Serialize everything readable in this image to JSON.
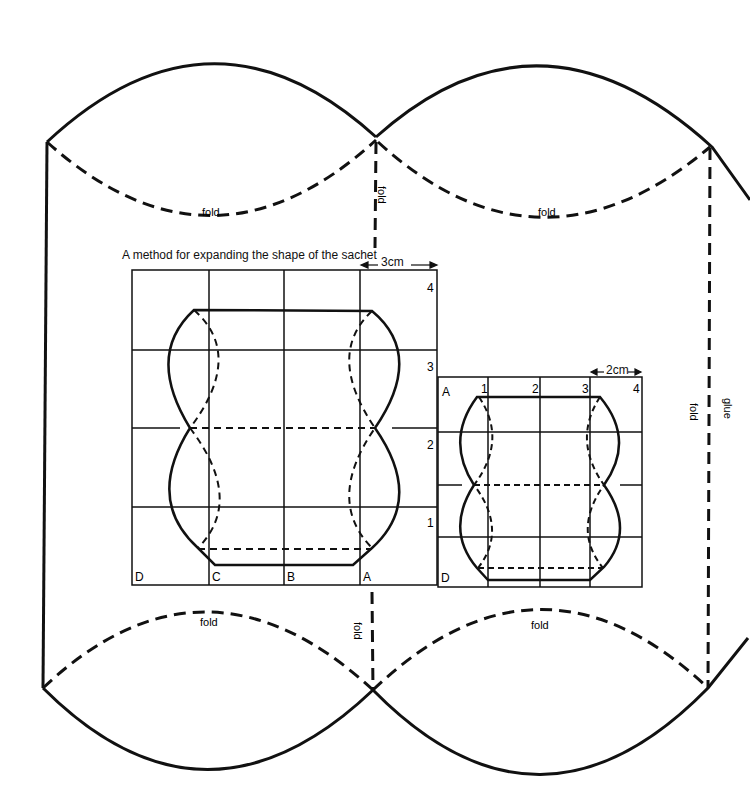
{
  "template": {
    "fold_labels": {
      "top_left": "fold",
      "top_right": "fold",
      "bottom_left": "fold",
      "bottom_right": "fold",
      "vertical_top_center": "fold",
      "vertical_bottom_center": "fold",
      "vertical_right": "fold"
    },
    "glue_label": "glue"
  },
  "inset": {
    "title": "A method for expanding the shape of the sachet",
    "large_grid": {
      "dimension": "3cm",
      "row_labels": [
        "4",
        "3",
        "2",
        "1"
      ],
      "column_labels": [
        "D",
        "C",
        "B",
        "A"
      ]
    },
    "small_grid": {
      "dimension": "2cm",
      "column_labels": [
        "A",
        "1",
        "2",
        "3",
        "4"
      ],
      "corner_label": "D"
    }
  },
  "colors": {
    "line": "#111111",
    "background": "#ffffff"
  }
}
